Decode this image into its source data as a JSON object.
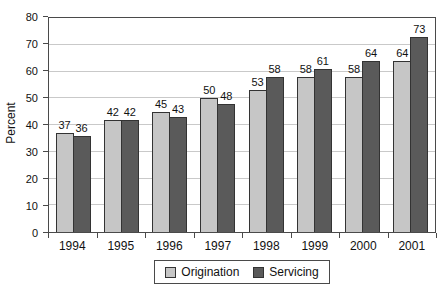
{
  "chart_data": {
    "type": "bar",
    "categories": [
      "1994",
      "1995",
      "1996",
      "1997",
      "1998",
      "1999",
      "2000",
      "2001"
    ],
    "series": [
      {
        "name": "Origination",
        "color": "#c6c6c6",
        "values": [
          37,
          42,
          45,
          50,
          53,
          58,
          58,
          64
        ]
      },
      {
        "name": "Servicing",
        "color": "#5a5a5a",
        "values": [
          36,
          42,
          43,
          48,
          58,
          61,
          64,
          73
        ]
      }
    ],
    "title": "",
    "xlabel": "",
    "ylabel": "Percent",
    "ylim": [
      0,
      80
    ],
    "ytick_step": 10,
    "grid": true,
    "legend_position": "bottom"
  },
  "legend": {
    "items": [
      {
        "label": "Origination",
        "swatch": "origination-swatch"
      },
      {
        "label": "Servicing",
        "swatch": "servicing-swatch"
      }
    ]
  }
}
